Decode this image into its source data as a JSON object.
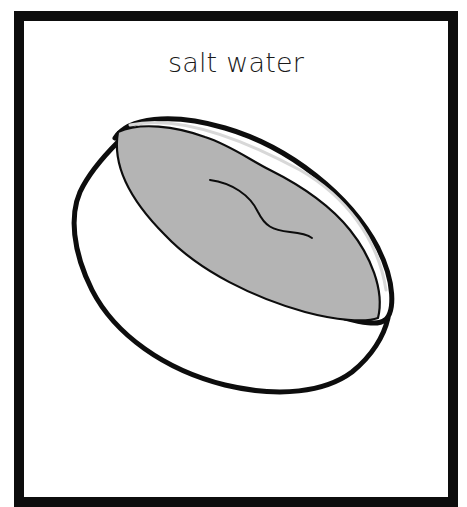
{
  "card": {
    "label": "salt water",
    "border_color": "#0d0d0d",
    "background_color": "#ffffff"
  },
  "illustration": {
    "subject": "bowl-of-salt-water",
    "liquid_color": "#b4b4b4",
    "outline_color": "#0d0d0d"
  }
}
